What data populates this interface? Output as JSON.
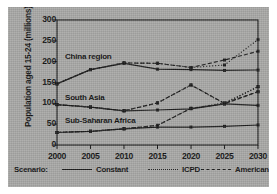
{
  "chart_data": {
    "type": "line",
    "title": "",
    "xlabel": "",
    "ylabel": "Population aged 15-24 (millions)",
    "x": [
      2000,
      2005,
      2010,
      2015,
      2020,
      2025,
      2030
    ],
    "xlim": [
      2000,
      2030
    ],
    "ylim": [
      0,
      300
    ],
    "yticks": [
      0,
      50,
      100,
      150,
      200,
      250,
      300
    ],
    "xticks": [
      "2000",
      "2005",
      "2010",
      "2015",
      "2020",
      "2025",
      "2030"
    ],
    "grid": false,
    "legend_position": "below-axes",
    "legend_title": "Scenario:",
    "marker": "square",
    "region_annotations": [
      {
        "text": "China region",
        "x": 2001.2,
        "y": 212
      },
      {
        "text": "South Asia",
        "x": 2001.2,
        "y": 112
      },
      {
        "text": "Sub-Saharan Africa",
        "x": 2001.2,
        "y": 58
      }
    ],
    "series": [
      {
        "name": "China region — Constant",
        "region": "China region",
        "scenario": "Constant",
        "style": "solid",
        "values": [
          147,
          181,
          196,
          182,
          181,
          179,
          180
        ]
      },
      {
        "name": "China region — ICPD",
        "region": "China region",
        "scenario": "ICPD",
        "style": "dotted",
        "values": [
          147,
          181,
          197,
          196,
          186,
          192,
          253
        ]
      },
      {
        "name": "China region — American",
        "region": "China region",
        "scenario": "American",
        "style": "dashed",
        "values": [
          147,
          181,
          197,
          196,
          186,
          204,
          225
        ]
      },
      {
        "name": "South Asia — Constant",
        "region": "South Asia",
        "scenario": "Constant",
        "style": "solid",
        "values": [
          97,
          91,
          82,
          84,
          87,
          99,
          95
        ]
      },
      {
        "name": "South Asia — ICPD",
        "region": "South Asia",
        "scenario": "ICPD",
        "style": "dotted",
        "values": [
          97,
          91,
          82,
          101,
          144,
          99,
          140
        ]
      },
      {
        "name": "South Asia — American",
        "region": "South Asia",
        "scenario": "American",
        "style": "dashed",
        "values": [
          97,
          91,
          82,
          101,
          144,
          100,
          128
        ]
      },
      {
        "name": "Sub-Saharan Africa — Constant",
        "region": "Sub-Saharan Africa",
        "scenario": "Constant",
        "style": "solid",
        "values": [
          30,
          33,
          39,
          43,
          43,
          45,
          48
        ]
      },
      {
        "name": "Sub-Saharan Africa — ICPD",
        "region": "Sub-Saharan Africa",
        "scenario": "ICPD",
        "style": "dotted",
        "values": [
          30,
          33,
          39,
          47,
          88,
          101,
          140
        ]
      },
      {
        "name": "Sub-Saharan Africa — American",
        "region": "Sub-Saharan Africa",
        "scenario": "American",
        "style": "dashed",
        "values": [
          30,
          33,
          39,
          47,
          88,
          99,
          128
        ]
      }
    ],
    "legend": [
      {
        "label": "Constant",
        "style": "solid"
      },
      {
        "label": "ICPD",
        "style": "dotted"
      },
      {
        "label": "American",
        "style": "dashed"
      }
    ],
    "colors": {
      "line": "#1b1b1b",
      "axis": "#161616",
      "background": "#a8a8a6",
      "text": "#111111"
    }
  }
}
